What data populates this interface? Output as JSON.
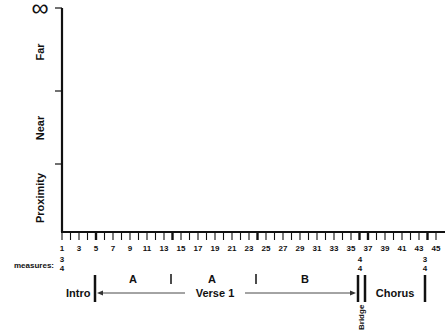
{
  "chart_data": {
    "type": "diagram",
    "title": "",
    "y_axis": {
      "top_symbol": "∞",
      "labels": [
        "Proximity",
        "Near",
        "Far"
      ]
    },
    "x_axis": {
      "label": "measures:",
      "range": [
        1,
        45
      ],
      "tick_labels": [
        "1",
        "3",
        "5",
        "7",
        "9",
        "11",
        "13",
        "15",
        "17",
        "19",
        "21",
        "23",
        "25",
        "27",
        "29",
        "31",
        "33",
        "35",
        "37",
        "39",
        "41",
        "43",
        "45"
      ]
    },
    "time_signatures": [
      {
        "measure": 1,
        "top": "3",
        "bottom": "4"
      },
      {
        "measure": 36,
        "top": "4",
        "bottom": "4"
      },
      {
        "measure": 44,
        "top": "3",
        "bottom": "4"
      }
    ],
    "sections": [
      {
        "name": "Intro",
        "start": 1,
        "end": 5
      },
      {
        "name": "Verse 1",
        "start": 5,
        "end": 36,
        "subsections": [
          {
            "name": "A",
            "start": 5,
            "end": 14
          },
          {
            "name": "A",
            "start": 14,
            "end": 24
          },
          {
            "name": "B",
            "start": 24,
            "end": 36
          }
        ]
      },
      {
        "name": "Bridge",
        "start": 36,
        "end": 37
      },
      {
        "name": "Chorus",
        "start": 37,
        "end": 44
      }
    ]
  },
  "labels": {
    "infinity": "∞",
    "far": "Far",
    "near": "Near",
    "proximity": "Proximity",
    "measures": "measures:",
    "ts1_top": "3",
    "ts1_bot": "4",
    "ts2_top": "4",
    "ts2_bot": "4",
    "ts3_top": "3",
    "ts3_bot": "4",
    "intro": "Intro",
    "verse": "Verse 1",
    "sub_a1": "A",
    "sub_a2": "A",
    "sub_b": "B",
    "bridge": "Bridge",
    "chorus": "Chorus"
  }
}
